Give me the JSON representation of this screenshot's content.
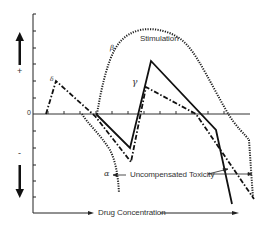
{
  "diagram": {
    "y_axis": {
      "positive_sign": "+",
      "negative_sign": "-",
      "zero_label": "0"
    },
    "x_axis": {
      "label": "Drug Concentration"
    },
    "labels": {
      "stimulation": "Stimulation",
      "uncompensated_toxicity": "Uncompensated Toxicity"
    },
    "curves": [
      {
        "id": "alpha",
        "symbol": "α",
        "style": "dotted"
      },
      {
        "id": "beta",
        "symbol": "β",
        "style": "dotted"
      },
      {
        "id": "gamma",
        "symbol": "γ",
        "style": "solid"
      },
      {
        "id": "delta",
        "symbol": "δ",
        "style": "dash-dot"
      }
    ],
    "colors": {
      "ink": "#1a1a1a",
      "background": "#ffffff"
    }
  }
}
